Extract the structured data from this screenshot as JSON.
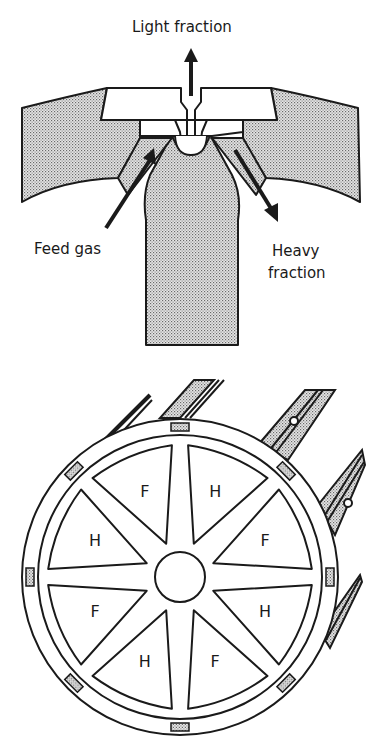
{
  "top_diagram": {
    "title": "Centrifuge cascade connection (cross-section)",
    "labels": {
      "light_fraction": "Light fraction",
      "feed_gas": "Feed gas",
      "heavy_line1": "Heavy",
      "heavy_line2": "fraction"
    }
  },
  "bottom_diagram": {
    "segments": [
      {
        "angle": -67.5,
        "label": "H"
      },
      {
        "angle": -22.5,
        "label": "F"
      },
      {
        "angle": 22.5,
        "label": "H"
      },
      {
        "angle": 67.5,
        "label": "F"
      },
      {
        "angle": 112.5,
        "label": "H"
      },
      {
        "angle": 157.5,
        "label": "F"
      },
      {
        "angle": 202.5,
        "label": "H"
      },
      {
        "angle": 247.5,
        "label": "F"
      }
    ]
  },
  "colors": {
    "ink": "#1a1a1a",
    "stipple": "#bdbdbd",
    "background": "#ffffff"
  }
}
